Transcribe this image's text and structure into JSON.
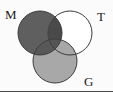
{
  "figure": {
    "kind": "venn-diagram",
    "width": 113,
    "height": 92,
    "background_color": "#fbfbfb",
    "baseline_color": "#4a4a4a"
  },
  "chart_data": {
    "type": "diagram",
    "subtype": "venn-3-set",
    "title": "",
    "xlabel": "",
    "ylabel": "",
    "legend_position": "inline-outside-circles",
    "grid": false,
    "sets": [
      {
        "id": "M",
        "label": "M",
        "label_position": "top-left",
        "label_x": 5,
        "label_y": 8,
        "cx": 40,
        "cy": 33,
        "r": 22,
        "fill": "#5f5f5f",
        "fill_shade": "dark-gray",
        "stroke": "#3b3b3b",
        "stroke_width": 1
      },
      {
        "id": "T",
        "label": "T",
        "label_position": "top-right",
        "label_x": 97,
        "label_y": 10,
        "cx": 70,
        "cy": 33,
        "r": 22,
        "fill": "#ffffff",
        "fill_shade": "white",
        "stroke": "#3b3b3b",
        "stroke_width": 1
      },
      {
        "id": "G",
        "label": "G",
        "label_position": "bottom-right",
        "label_x": 84,
        "label_y": 75,
        "cx": 55,
        "cy": 61,
        "r": 22,
        "fill": "#a8a8a8",
        "fill_shade": "medium-gray",
        "stroke": "#3b3b3b",
        "stroke_width": 1
      }
    ],
    "regions": [
      {
        "id": "M-only",
        "sets": [
          "M"
        ],
        "shade": "dark-gray",
        "color": "#5f5f5f"
      },
      {
        "id": "T-only",
        "sets": [
          "T"
        ],
        "shade": "white",
        "color": "#ffffff"
      },
      {
        "id": "G-only",
        "sets": [
          "G"
        ],
        "shade": "medium-gray",
        "color": "#a8a8a8"
      },
      {
        "id": "M-and-T",
        "sets": [
          "M",
          "T"
        ],
        "shade": "darkest-gray",
        "color": "#4a4a4a"
      },
      {
        "id": "M-and-G",
        "sets": [
          "M",
          "G"
        ],
        "shade": "dark-gray",
        "color": "#585858"
      },
      {
        "id": "T-and-G",
        "sets": [
          "T",
          "G"
        ],
        "shade": "medium-gray",
        "color": "#a8a8a8"
      },
      {
        "id": "M-T-G",
        "sets": [
          "M",
          "T",
          "G"
        ],
        "shade": "dark-gray",
        "color": "#555555"
      }
    ]
  }
}
